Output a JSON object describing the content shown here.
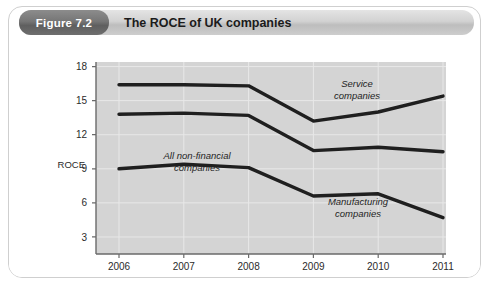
{
  "figure": {
    "badge_label": "Figure 7.2",
    "title": "The ROCE of UK companies"
  },
  "chart_data": {
    "type": "line",
    "title": "The ROCE of UK companies",
    "xlabel": "",
    "ylabel": "ROCE",
    "x": [
      "2006",
      "2007",
      "2008",
      "2009",
      "2010",
      "2011"
    ],
    "categories": [
      "2006",
      "2007",
      "2008",
      "2009",
      "2010",
      "2011"
    ],
    "xtick_labels": [
      "2006",
      "2007",
      "2008",
      "2009",
      "2010",
      "2011"
    ],
    "ytick_labels": [
      "18",
      "15",
      "12",
      "9",
      "6",
      "3"
    ],
    "yticks": [
      18,
      15,
      12,
      9,
      6,
      3
    ],
    "ylim": [
      1.5,
      18.4
    ],
    "grid": true,
    "legend_position": "inline-annotations",
    "plot_background": "#d4d4d4",
    "line_color": "#1f1f1f",
    "series": [
      {
        "name": "Service companies",
        "annotation": [
          "Service",
          "companies"
        ],
        "values": [
          16.4,
          16.4,
          16.3,
          13.2,
          14.0,
          15.4
        ]
      },
      {
        "name": "All non-financial companies",
        "annotation": [
          "All non-financial",
          "companies"
        ],
        "values": [
          13.8,
          13.9,
          13.7,
          10.6,
          10.9,
          10.5
        ]
      },
      {
        "name": "Manufacturing companies",
        "annotation": [
          "Manufacturing",
          "companies"
        ],
        "values": [
          9.0,
          9.4,
          9.1,
          6.6,
          6.8,
          4.7
        ]
      }
    ],
    "annotations": [
      {
        "id": "service",
        "line1": "Service",
        "line2": "companies"
      },
      {
        "id": "all-non-financial",
        "line1": "All non-financial",
        "line2": "companies"
      },
      {
        "id": "manufacturing",
        "line1": "Manufacturing",
        "line2": "companies"
      }
    ]
  }
}
